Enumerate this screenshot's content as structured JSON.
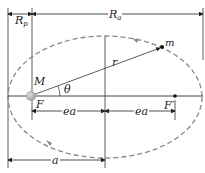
{
  "diagram": {
    "labels": {
      "Rp": "R",
      "Rp_sub": "p",
      "Ra": "R",
      "Ra_sub": "a",
      "M": "M",
      "F": "F",
      "theta": "θ",
      "r": "r",
      "m": "m",
      "F_prime": "F′",
      "ea_left": "ea",
      "ea_right": "ea",
      "a": "a"
    },
    "colors": {
      "orbit": "#888888",
      "lines": "#222222",
      "central_body": "#b5b5b5"
    }
  }
}
